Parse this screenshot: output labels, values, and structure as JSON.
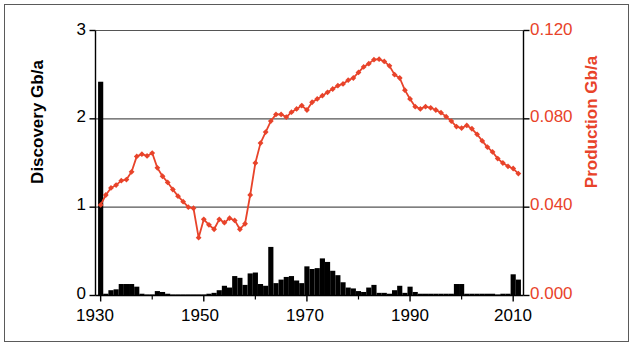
{
  "chart_data": {
    "type": "bar",
    "title": "",
    "subtitle": "",
    "xlabel": "",
    "ylabel": "Discovery Gb/a",
    "y2label": "Production Gb/a",
    "xlim": [
      1928,
      2012
    ],
    "ylim": [
      0,
      3
    ],
    "y2lim": [
      0.0,
      0.12
    ],
    "grid": true,
    "grid_axis": "y",
    "legend": "none",
    "x_ticks": [
      "1930",
      "1950",
      "1970",
      "1990",
      "2010"
    ],
    "x_tick_values": [
      1930,
      1950,
      1970,
      1990,
      2010
    ],
    "x_minor_tick_values": [
      1940,
      1960,
      1980,
      2000
    ],
    "y_ticks": [
      "0",
      "1",
      "2",
      "3"
    ],
    "y_tick_values": [
      0,
      1,
      2,
      3
    ],
    "y2_ticks": [
      "0.000",
      "0.040",
      "0.080",
      "0.120"
    ],
    "y2_tick_values": [
      0.0,
      0.04,
      0.08,
      0.12
    ],
    "colors": {
      "bars": "#000000",
      "line": "#e8432a",
      "axis": "#000000",
      "grid": "#555555",
      "background": "#ffffff",
      "frame": "#5a5a5a"
    },
    "series": [
      {
        "name": "Discovery",
        "type": "bar",
        "axis": "left",
        "unit": "Gb/a",
        "color": "#000000",
        "x": [
          1930,
          1931,
          1932,
          1933,
          1934,
          1935,
          1936,
          1937,
          1938,
          1939,
          1940,
          1941,
          1942,
          1943,
          1944,
          1945,
          1946,
          1947,
          1948,
          1949,
          1950,
          1951,
          1952,
          1953,
          1954,
          1955,
          1956,
          1957,
          1958,
          1959,
          1960,
          1961,
          1962,
          1963,
          1964,
          1965,
          1966,
          1967,
          1968,
          1969,
          1970,
          1971,
          1972,
          1973,
          1974,
          1975,
          1976,
          1977,
          1978,
          1979,
          1980,
          1981,
          1982,
          1983,
          1984,
          1985,
          1986,
          1987,
          1988,
          1989,
          1990,
          1991,
          1992,
          1993,
          1994,
          1995,
          1996,
          1997,
          1998,
          1999,
          2000,
          2001,
          2002,
          2003,
          2004,
          2005,
          2006,
          2007,
          2008,
          2009,
          2010,
          2011
        ],
        "values": [
          2.42,
          0.02,
          0.06,
          0.07,
          0.13,
          0.13,
          0.13,
          0.1,
          0.02,
          0.01,
          0.01,
          0.05,
          0.04,
          0.02,
          0.01,
          0.01,
          0.01,
          0.01,
          0.01,
          0.01,
          0.01,
          0.02,
          0.03,
          0.06,
          0.11,
          0.09,
          0.22,
          0.2,
          0.12,
          0.25,
          0.26,
          0.13,
          0.11,
          0.55,
          0.14,
          0.18,
          0.21,
          0.22,
          0.17,
          0.14,
          0.33,
          0.3,
          0.31,
          0.42,
          0.38,
          0.28,
          0.23,
          0.15,
          0.09,
          0.08,
          0.05,
          0.04,
          0.09,
          0.12,
          0.03,
          0.03,
          0.02,
          0.06,
          0.11,
          0.03,
          0.1,
          0.04,
          0.02,
          0.02,
          0.02,
          0.02,
          0.02,
          0.02,
          0.02,
          0.13,
          0.13,
          0.02,
          0.02,
          0.02,
          0.02,
          0.02,
          0.02,
          0.01,
          0.02,
          0.02,
          0.24,
          0.18
        ]
      },
      {
        "name": "Production",
        "type": "line",
        "axis": "right",
        "unit": "Gb/a",
        "color": "#e8432a",
        "marker": "diamond",
        "x": [
          1930,
          1931,
          1932,
          1933,
          1934,
          1935,
          1936,
          1937,
          1938,
          1939,
          1940,
          1941,
          1942,
          1943,
          1944,
          1945,
          1946,
          1947,
          1948,
          1949,
          1950,
          1951,
          1952,
          1953,
          1954,
          1955,
          1956,
          1957,
          1958,
          1959,
          1960,
          1961,
          1962,
          1963,
          1964,
          1965,
          1966,
          1967,
          1968,
          1969,
          1970,
          1971,
          1972,
          1973,
          1974,
          1975,
          1976,
          1977,
          1978,
          1979,
          1980,
          1981,
          1982,
          1983,
          1984,
          1985,
          1986,
          1987,
          1988,
          1989,
          1990,
          1991,
          1992,
          1993,
          1994,
          1995,
          1996,
          1997,
          1998,
          1999,
          2000,
          2001,
          2002,
          2003,
          2004,
          2005,
          2006,
          2007,
          2008,
          2009,
          2010,
          2011
        ],
        "values": [
          0.041,
          0.0455,
          0.0487,
          0.05,
          0.052,
          0.0525,
          0.056,
          0.063,
          0.064,
          0.0632,
          0.0645,
          0.0578,
          0.054,
          0.0512,
          0.048,
          0.045,
          0.0425,
          0.04,
          0.0395,
          0.0262,
          0.0345,
          0.032,
          0.03,
          0.0345,
          0.033,
          0.035,
          0.034,
          0.03,
          0.0325,
          0.0455,
          0.06,
          0.069,
          0.074,
          0.079,
          0.082,
          0.082,
          0.0808,
          0.083,
          0.0845,
          0.086,
          0.084,
          0.0875,
          0.089,
          0.0905,
          0.092,
          0.0935,
          0.095,
          0.0958,
          0.0975,
          0.0985,
          0.101,
          0.1035,
          0.105,
          0.1068,
          0.107,
          0.106,
          0.104,
          0.1,
          0.0985,
          0.093,
          0.089,
          0.0855,
          0.0845,
          0.0855,
          0.085,
          0.084,
          0.0828,
          0.081,
          0.079,
          0.0765,
          0.0758,
          0.077,
          0.0755,
          0.073,
          0.07,
          0.0672,
          0.065,
          0.062,
          0.06,
          0.0585,
          0.0575,
          0.0552
        ]
      }
    ],
    "annotations": []
  },
  "axes": {
    "left": {
      "title": "Discovery Gb/a",
      "tick_labels": [
        "3",
        "2",
        "1",
        "0"
      ]
    },
    "right": {
      "title": "Production Gb/a",
      "tick_labels": [
        "0.120",
        "0.080",
        "0.040",
        "0.000"
      ]
    },
    "bottom": {
      "tick_labels": [
        "1930",
        "1950",
        "1970",
        "1990",
        "2010"
      ]
    }
  }
}
